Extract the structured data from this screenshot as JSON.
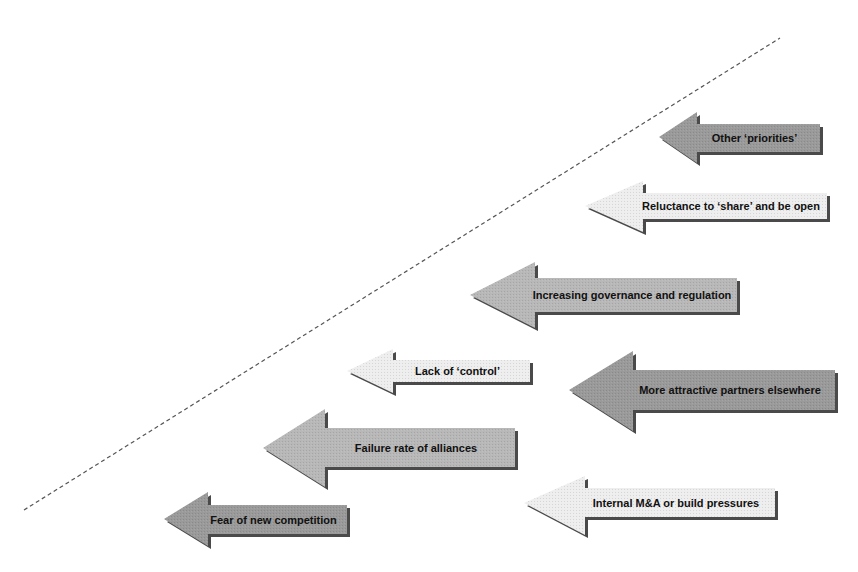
{
  "diagram": {
    "type": "arrow-barriers",
    "divider": {
      "style": "dashed",
      "color": "#555555",
      "from": [
        24,
        510
      ],
      "to": [
        780,
        38
      ]
    },
    "colors": {
      "dark": "#9a9a9a",
      "medium": "#b8b8b8",
      "light": "#eeeeee",
      "shadow": "#4a4a4a"
    },
    "arrows": [
      {
        "id": "other-priorities",
        "label": "Other ‘priorities’",
        "shade": "dark",
        "tip": [
          659,
          137
        ],
        "head_base_x": 697,
        "head_top": 112,
        "head_bottom": 163,
        "body_top": 124,
        "body_bottom": 152,
        "right": 820,
        "font_size": 11
      },
      {
        "id": "reluctance-to-share",
        "label": "Reluctance to ‘share’ and be open",
        "shade": "light",
        "tip": [
          585,
          206
        ],
        "head_base_x": 643,
        "head_top": 181,
        "head_bottom": 232,
        "body_top": 193,
        "body_bottom": 219,
        "right": 827,
        "font_size": 11
      },
      {
        "id": "increasing-governance",
        "label": "Increasing governance and regulation",
        "shade": "medium",
        "tip": [
          470,
          295
        ],
        "head_base_x": 535,
        "head_top": 262,
        "head_bottom": 328,
        "body_top": 278,
        "body_bottom": 312,
        "right": 737,
        "font_size": 11
      },
      {
        "id": "lack-of-control",
        "label": "Lack of ‘control’",
        "shade": "light",
        "tip": [
          347,
          371
        ],
        "head_base_x": 393,
        "head_top": 349,
        "head_bottom": 393,
        "body_top": 360,
        "body_bottom": 382,
        "right": 530,
        "font_size": 11
      },
      {
        "id": "more-attractive-partners",
        "label": "More attractive partners elsewhere",
        "shade": "dark",
        "tip": [
          569,
          390
        ],
        "head_base_x": 633,
        "head_top": 351,
        "head_bottom": 431,
        "body_top": 370,
        "body_bottom": 410,
        "right": 835,
        "font_size": 11
      },
      {
        "id": "failure-rate-of-alliances",
        "label": "Failure rate of alliances",
        "shade": "medium",
        "tip": [
          263,
          448
        ],
        "head_base_x": 325,
        "head_top": 409,
        "head_bottom": 487,
        "body_top": 428,
        "body_bottom": 467,
        "right": 515,
        "font_size": 11
      },
      {
        "id": "internal-ma-pressures",
        "label": "Internal M&A or build pressures",
        "shade": "light",
        "tip": [
          524,
          503
        ],
        "head_base_x": 585,
        "head_top": 476,
        "head_bottom": 535,
        "body_top": 488,
        "body_bottom": 517,
        "right": 775,
        "font_size": 11
      },
      {
        "id": "fear-of-new-competition",
        "label": "Fear of new competition",
        "shade": "dark",
        "tip": [
          164,
          519
        ],
        "head_base_x": 208,
        "head_top": 492,
        "head_bottom": 546,
        "body_top": 505,
        "body_bottom": 534,
        "right": 347,
        "font_size": 11
      }
    ]
  }
}
